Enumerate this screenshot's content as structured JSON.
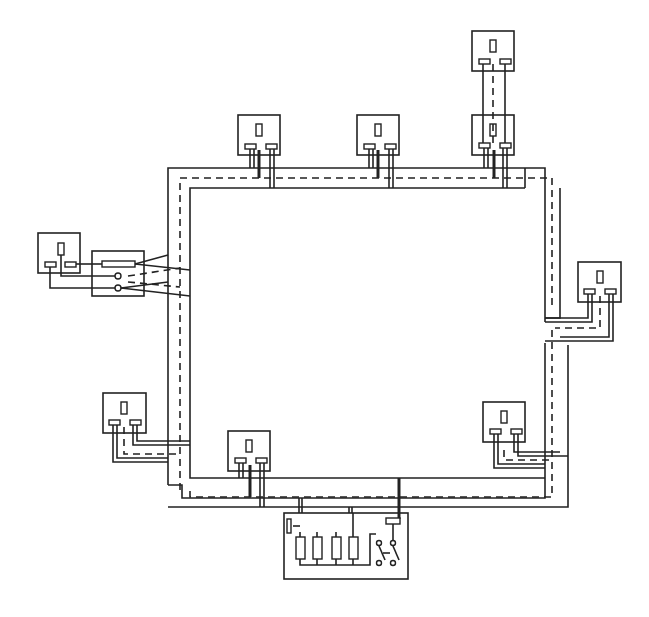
{
  "diagram": {
    "title": "Ring main circuit wiring diagram",
    "type": "electrical ring final circuit",
    "colors": {
      "line": "#222222",
      "background": "#ffffff"
    },
    "consumer_unit": {
      "label": "Consumer unit",
      "fuses": 4,
      "main_switch": "double-pole switch",
      "earth_block": true
    },
    "fused_spur": {
      "label": "Fused connection unit",
      "has_fuse": true,
      "terminals": 2
    },
    "sockets": [
      {
        "id": "socket-top-left",
        "position": "top"
      },
      {
        "id": "socket-top-middle",
        "position": "top"
      },
      {
        "id": "socket-top-right",
        "position": "top"
      },
      {
        "id": "socket-spur-top",
        "position": "spur above top-right socket"
      },
      {
        "id": "socket-right",
        "position": "right side"
      },
      {
        "id": "socket-bottom-right",
        "position": "bottom right"
      },
      {
        "id": "socket-bottom-middle",
        "position": "bottom"
      },
      {
        "id": "socket-bottom-left",
        "position": "left side lower"
      },
      {
        "id": "socket-fused-spur",
        "position": "left, via fused connection unit"
      }
    ],
    "legend": {
      "solid": "live / neutral conductors",
      "dashed": "earth conductor"
    }
  }
}
